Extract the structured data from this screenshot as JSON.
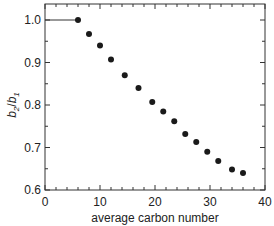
{
  "chart_data": {
    "type": "scatter",
    "title": "",
    "xlabel": "average carbon number",
    "ylabel": "b2/b1",
    "ylabel_parts": {
      "b": "b",
      "sub2": "2",
      "slash": "/",
      "sub1": "1"
    },
    "xlim": [
      0,
      40
    ],
    "ylim": [
      0.6,
      1.04
    ],
    "xticks": [
      0,
      10,
      20,
      30,
      40
    ],
    "xtick_labels": [
      "0",
      "10",
      "20",
      "30",
      "40"
    ],
    "yticks": [
      0.6,
      0.7,
      0.8,
      0.9,
      1.0
    ],
    "ytick_labels": [
      "0.6",
      "0.7",
      "0.8",
      "0.9",
      "1.0"
    ],
    "grid": false,
    "legend": null,
    "series": [
      {
        "name": "b2/b1",
        "marker": "filled-circle",
        "color": "#1a1a1a",
        "x": [
          6,
          8,
          10,
          12,
          14.5,
          17,
          19.5,
          21.5,
          23.5,
          25.5,
          27.5,
          29.5,
          31.5,
          34,
          36
        ],
        "y": [
          1.0,
          0.967,
          0.94,
          0.907,
          0.87,
          0.84,
          0.807,
          0.785,
          0.762,
          0.732,
          0.713,
          0.69,
          0.668,
          0.648,
          0.64
        ]
      }
    ],
    "reference_line": {
      "x": [
        0,
        6
      ],
      "y": [
        1.0,
        1.0
      ],
      "style": "solid"
    }
  }
}
